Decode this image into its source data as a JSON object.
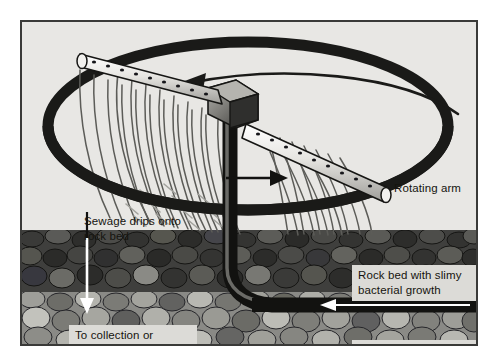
{
  "figure": {
    "background_color": "#e8e7e4",
    "frame_color": "#3a3a38",
    "ink_color": "#15140f",
    "callout_bg": "#dcdbd7",
    "rock_dark_color": "#4a4a48",
    "rock_light_color": "#8d8d8a"
  },
  "labels": {
    "rotating_arm": "Rotating arm",
    "sewage_drips": "Sewage drips onto\nrock bed",
    "to_collection": "To collection or\ngroundwater",
    "rock_bed": "Rock bed with slimy\nbacterial growth",
    "sewage_pumped": "Sewage pumped in"
  },
  "parts": {
    "rotation_path": "rotation-ellipse",
    "rotation_direction_arrow": "counterclockwise-arrow",
    "spray_arm": "perforated-rotating-arm",
    "hub": "central-hub-block",
    "standpipe": "vertical-feed-pipe",
    "spray": "sewage-spray-streaks",
    "drip_arrow": "downward-drip-arrow",
    "outward_arrow": "outward-flow-arrow",
    "inlet_pipe": "horizontal-inlet-pipe",
    "inlet_arrow": "inlet-flow-arrow",
    "rock_bed_upper": "dark-rock-layer",
    "rock_bed_lower": "light-rock-layer"
  }
}
